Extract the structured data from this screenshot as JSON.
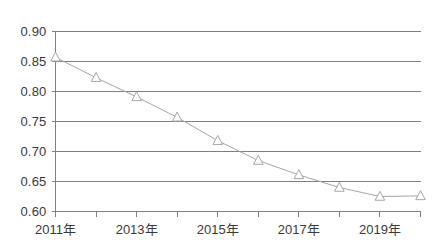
{
  "chart_data": {
    "type": "line",
    "title": "",
    "subtitle": "",
    "xlabel": "",
    "ylabel": "",
    "x": [
      "2011年",
      "2012年",
      "2013年",
      "2014年",
      "2015年",
      "2016年",
      "2017年",
      "2018年",
      "2019年",
      "2020年"
    ],
    "categories": [
      "2011年",
      "2012年",
      "2013年",
      "2014年",
      "2015年",
      "2016年",
      "2017年",
      "2018年",
      "2019年",
      "2020年"
    ],
    "values": [
      0.857,
      0.823,
      0.791,
      0.757,
      0.718,
      0.685,
      0.661,
      0.64,
      0.625,
      0.626
    ],
    "series": [
      {
        "name": "",
        "values": [
          0.857,
          0.823,
          0.791,
          0.757,
          0.718,
          0.685,
          0.661,
          0.64,
          0.625,
          0.626
        ]
      }
    ],
    "ylim": [
      0.6,
      0.9
    ],
    "xlim": [
      0,
      9
    ],
    "y_ticks": [
      0.9,
      0.85,
      0.8,
      0.75,
      0.7,
      0.65,
      0.6
    ],
    "y_tick_labels": [
      "0.90",
      "0.85",
      "0.80",
      "0.75",
      "0.70",
      "0.65",
      "0.60"
    ],
    "x_tick_labels": [
      "2011年",
      "2013年",
      "2015年",
      "2017年",
      "2019年"
    ],
    "x_tick_label_indices": [
      0,
      2,
      4,
      6,
      8
    ],
    "grid": true,
    "grid_axis": "y",
    "legend": false,
    "legend_position": "none",
    "marker": "triangle-open",
    "line_color": "#a6a6a6",
    "marker_color": "#a6a6a6",
    "grid_color": "#808080",
    "axis_color": "#808080",
    "text_color": "#3a3a3a",
    "background": "#ffffff"
  },
  "axes": {
    "y_labels": [
      "0.90",
      "0.85",
      "0.80",
      "0.75",
      "0.70",
      "0.65",
      "0.60"
    ],
    "x_labels": [
      "2011年",
      "2013年",
      "2015年",
      "2017年",
      "2019年"
    ]
  }
}
